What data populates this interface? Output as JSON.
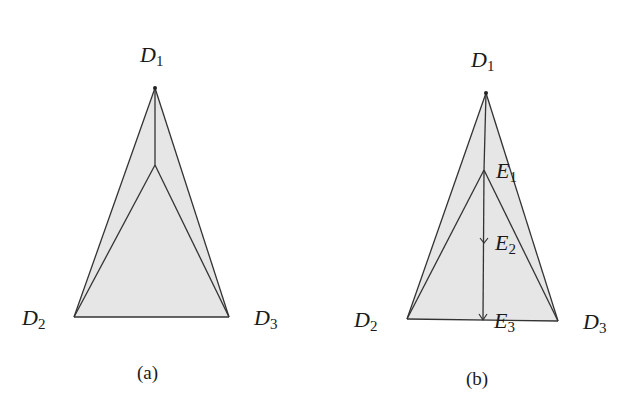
{
  "figure": {
    "panels": [
      {
        "id": "a",
        "caption": "(a)",
        "vertices": {
          "D1": {
            "label": "D",
            "sub": "1",
            "x": 155,
            "y": 88
          },
          "D2": {
            "label": "D",
            "sub": "2",
            "x": 74,
            "y": 317
          },
          "D3": {
            "label": "D",
            "sub": "3",
            "x": 229,
            "y": 317
          },
          "C": {
            "x": 155,
            "y": 165
          }
        },
        "edges": [
          [
            "D1",
            "D2"
          ],
          [
            "D1",
            "D3"
          ],
          [
            "D2",
            "D3"
          ],
          [
            "D1",
            "C"
          ],
          [
            "C",
            "D2"
          ],
          [
            "C",
            "D3"
          ]
        ]
      },
      {
        "id": "b",
        "caption": "(b)",
        "vertices": {
          "D1": {
            "label": "D",
            "sub": "1",
            "x": 486,
            "y": 93
          },
          "D2": {
            "label": "D",
            "sub": "2",
            "x": 407,
            "y": 319
          },
          "D3": {
            "label": "D",
            "sub": "3",
            "x": 558,
            "y": 321
          },
          "E1": {
            "label": "E",
            "sub": "1",
            "x": 484,
            "y": 170
          },
          "E2": {
            "label": "E",
            "sub": "2",
            "x": 484,
            "y": 242
          },
          "E3": {
            "label": "E",
            "sub": "3",
            "x": 483,
            "y": 320
          }
        },
        "edges": [
          [
            "D1",
            "D2"
          ],
          [
            "D1",
            "D3"
          ],
          [
            "D2",
            "D3"
          ],
          [
            "D1",
            "E1"
          ],
          [
            "E1",
            "D2"
          ],
          [
            "E1",
            "D3"
          ],
          [
            "E1",
            "E3"
          ]
        ],
        "arrows": [
          [
            "E1",
            "E2"
          ],
          [
            "E2",
            "E3"
          ]
        ]
      }
    ],
    "colors": {
      "fill": "#e6e6e6",
      "stroke": "#333333",
      "text": "#1a1a1a"
    }
  }
}
